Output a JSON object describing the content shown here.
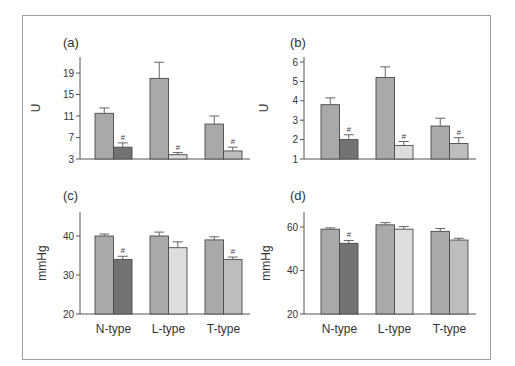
{
  "figure": {
    "panels": [
      "(a)",
      "(b)",
      "(c)",
      "(d)"
    ]
  },
  "colors": {
    "control": "#a9a9a9",
    "n_type_treated": "#737373",
    "l_type_treated": "#dddddd",
    "t_type_treated": "#bdbdbd",
    "outline": "#4a4a4a",
    "frame": "#a0a0a0"
  },
  "chart_data": [
    {
      "panel": "(a)",
      "type": "bar",
      "ylabel": "U",
      "xlabel": "",
      "categories": [
        "N-type",
        "L-type",
        "T-type"
      ],
      "show_category_labels": false,
      "yticks": [
        3,
        7,
        11,
        15,
        19
      ],
      "ylim": [
        3,
        22
      ],
      "series": [
        {
          "name": "control",
          "values": [
            11.5,
            18.0,
            9.5
          ],
          "errors": [
            1.0,
            3.0,
            1.5
          ]
        },
        {
          "name": "treated",
          "values": [
            5.2,
            3.8,
            4.5
          ],
          "errors": [
            0.8,
            0.4,
            0.7
          ],
          "significance": [
            "#",
            "#",
            "#"
          ]
        }
      ]
    },
    {
      "panel": "(b)",
      "type": "bar",
      "ylabel": "U",
      "xlabel": "",
      "categories": [
        "N-type",
        "L-type",
        "T-type"
      ],
      "show_category_labels": false,
      "yticks": [
        1,
        2,
        3,
        4,
        5,
        6
      ],
      "ylim": [
        1,
        6.2
      ],
      "series": [
        {
          "name": "control",
          "values": [
            3.8,
            5.2,
            2.7
          ],
          "errors": [
            0.35,
            0.55,
            0.4
          ]
        },
        {
          "name": "treated",
          "values": [
            2.0,
            1.7,
            1.8
          ],
          "errors": [
            0.25,
            0.2,
            0.3
          ],
          "significance": [
            "#",
            "#",
            "#"
          ]
        }
      ]
    },
    {
      "panel": "(c)",
      "type": "bar",
      "ylabel": "mmHg",
      "xlabel": "",
      "categories": [
        "N-type",
        "L-type",
        "T-type"
      ],
      "show_category_labels": true,
      "yticks": [
        20,
        30,
        40
      ],
      "ylim": [
        20,
        46
      ],
      "series": [
        {
          "name": "control",
          "values": [
            40,
            40,
            39
          ],
          "errors": [
            0.5,
            1.0,
            0.8
          ]
        },
        {
          "name": "treated",
          "values": [
            34,
            37,
            34
          ],
          "errors": [
            0.8,
            1.5,
            0.6
          ],
          "significance": [
            "#",
            "",
            "#"
          ]
        }
      ]
    },
    {
      "panel": "(d)",
      "type": "bar",
      "ylabel": "mmHg",
      "xlabel": "",
      "categories": [
        "N-type",
        "L-type",
        "T-type"
      ],
      "show_category_labels": true,
      "yticks": [
        20,
        40,
        60
      ],
      "ylim": [
        20,
        66
      ],
      "series": [
        {
          "name": "control",
          "values": [
            59,
            61,
            58
          ],
          "errors": [
            0.6,
            1.0,
            1.3
          ]
        },
        {
          "name": "treated",
          "values": [
            52.5,
            59,
            54
          ],
          "errors": [
            1.3,
            1.2,
            0.8
          ],
          "significance": [
            "#",
            "",
            ""
          ]
        }
      ]
    }
  ]
}
